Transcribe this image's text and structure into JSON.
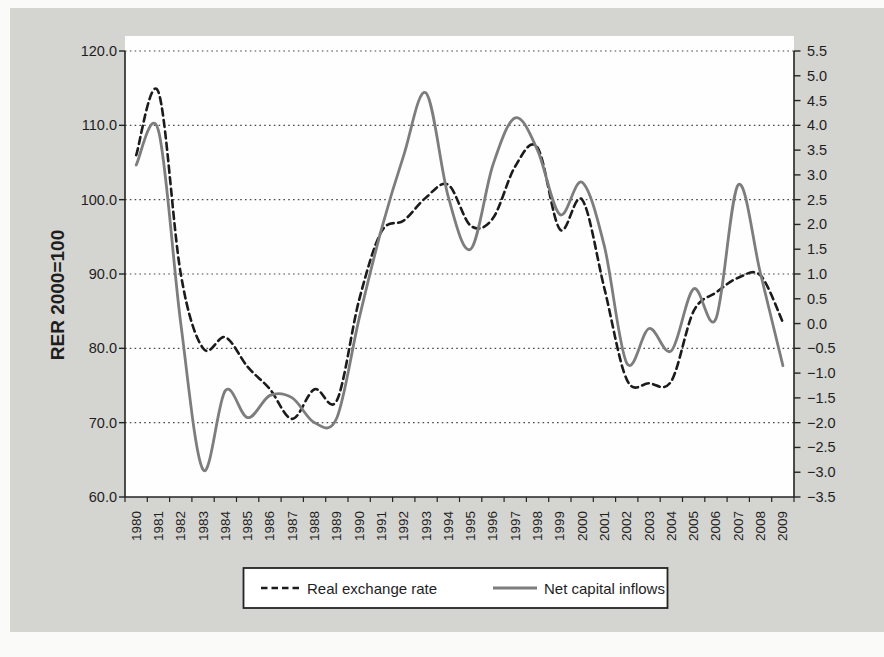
{
  "chart_data": {
    "type": "line",
    "title": "",
    "x_labels": [
      "1980",
      "1981",
      "1982",
      "1983",
      "1984",
      "1985",
      "1986",
      "1987",
      "1988",
      "1989",
      "1990",
      "1991",
      "1992",
      "1993",
      "1994",
      "1995",
      "1996",
      "1997",
      "1998",
      "1999",
      "2000",
      "2001",
      "2002",
      "2003",
      "2004",
      "2005",
      "2006",
      "2007",
      "2008",
      "2009"
    ],
    "series": [
      {
        "name": "Real exchange rate",
        "axis": "left",
        "line_style": "dashed",
        "color": "#1b1b1b",
        "values": [
          106,
          114.5,
          90,
          80,
          81.5,
          77.5,
          74.5,
          70.5,
          74.5,
          73,
          86.5,
          95.7,
          97.2,
          100.3,
          102,
          96.5,
          97.5,
          104.5,
          107,
          96,
          100,
          88,
          75.8,
          75.3,
          75.6,
          85,
          87.5,
          89.5,
          89.8,
          83.5
        ]
      },
      {
        "name": "Net capital inflows",
        "axis": "right",
        "line_style": "solid",
        "color": "#7d7d7d",
        "values": [
          3.2,
          3.9,
          0.0,
          -2.95,
          -1.35,
          -1.9,
          -1.45,
          -1.5,
          -2.0,
          -1.9,
          0.1,
          1.9,
          3.4,
          4.65,
          2.55,
          1.5,
          3.2,
          4.15,
          3.5,
          2.2,
          2.85,
          1.55,
          -0.8,
          -0.1,
          -0.55,
          0.7,
          0.1,
          2.8,
          1.0,
          -0.85
        ]
      }
    ],
    "left_axis": {
      "title": "RER 2000=100",
      "min": 60,
      "max": 120,
      "tick_labels": [
        "120.0",
        "110.0",
        "100.0",
        "90.0",
        "80.0",
        "70.0",
        "60.0"
      ],
      "tick_values": [
        120,
        110,
        100,
        90,
        80,
        70,
        60
      ]
    },
    "right_axis": {
      "title": "",
      "min": -3.5,
      "max": 5.5,
      "tick_labels": [
        "5.5",
        "5.0",
        "4.5",
        "4.0",
        "3.5",
        "3.0",
        "2.5",
        "2.0",
        "1.5",
        "1.0",
        "0.5",
        "0.0",
        "−0.5",
        "−1.0",
        "−1.5",
        "−2.0",
        "−2.5",
        "−3.0",
        "−3.5"
      ],
      "tick_values": [
        5.5,
        5.0,
        4.5,
        4.0,
        3.5,
        3.0,
        2.5,
        2.0,
        1.5,
        1.0,
        0.5,
        0.0,
        -0.5,
        -1.0,
        -1.5,
        -2.0,
        -2.5,
        -3.0,
        -3.5
      ]
    },
    "gridline_values_left": [
      120,
      110,
      100,
      90,
      80,
      70
    ],
    "grid": "horizontal-dotted",
    "legend": {
      "position": "bottom-center",
      "entries": [
        "Real exchange rate",
        "Net capital inflows"
      ]
    }
  },
  "colors": {
    "page_bg": "#fafaf8",
    "panel_bg": "#d4d4d1",
    "plot_bg": "#fefefe",
    "axis": "#242424",
    "grid": "#4a4a4a",
    "dashed_series": "#1b1b1b",
    "solid_series": "#7d7d7d",
    "legend_bg": "#ffffff"
  }
}
